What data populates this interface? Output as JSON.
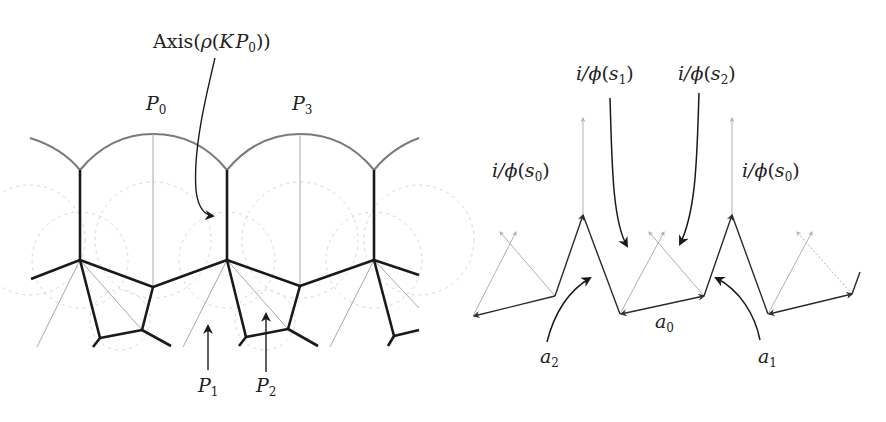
{
  "figure": {
    "left_panel": {
      "name": "tiling-diagram",
      "labels": {
        "axis": {
          "prefix": "Axis(",
          "rho": "ρ",
          "open": "(",
          "K": "K",
          "P": "P",
          "sub": "0",
          "close": "))"
        },
        "P0": {
          "base": "P",
          "sub": "0"
        },
        "P3": {
          "base": "P",
          "sub": "3"
        },
        "P1": {
          "base": "P",
          "sub": "1"
        },
        "P2": {
          "base": "P",
          "sub": "2"
        }
      }
    },
    "right_panel": {
      "name": "zigzag-arrow-diagram",
      "labels": {
        "s1": {
          "pre": "i/",
          "phi": "ϕ",
          "open": "(",
          "s": "s",
          "sub": "1",
          "close": ")"
        },
        "s2": {
          "pre": "i/",
          "phi": "ϕ",
          "open": "(",
          "s": "s",
          "sub": "2",
          "close": ")"
        },
        "s0_left": {
          "pre": "i/",
          "phi": "ϕ",
          "open": "(",
          "s": "s",
          "sub": "0",
          "close": ")"
        },
        "s0_right": {
          "pre": "i/",
          "phi": "ϕ",
          "open": "(",
          "s": "s",
          "sub": "0",
          "close": ")"
        },
        "a0": {
          "base": "a",
          "sub": "0"
        },
        "a1": {
          "base": "a",
          "sub": "1"
        },
        "a2": {
          "base": "a",
          "sub": "2"
        }
      }
    },
    "colors": {
      "thick_edge": "#1a1a1a",
      "arc": "#7a7a7a",
      "thin_line": "#a8a8a8",
      "dashed": "#d4d4d4",
      "faint_arrow": "#b0b0b0"
    }
  }
}
